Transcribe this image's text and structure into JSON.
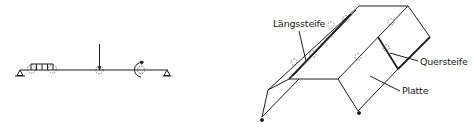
{
  "figure": {
    "left_diagram": {
      "description": "beam-with-loads",
      "elements": [
        "pin-support-left",
        "distributed-load",
        "point-load",
        "moment-load",
        "pin-support-right"
      ]
    },
    "right_diagram": {
      "description": "stiffened-plate-structure",
      "labels": {
        "longitudinal_stiffener": "Längssteife",
        "transverse_stiffener": "Quersteife",
        "plate": "Platte"
      }
    }
  },
  "colors": {
    "line": "#1e1e1e",
    "background": "#ffffff"
  }
}
